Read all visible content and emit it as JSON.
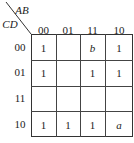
{
  "kmap": {
    "row_var": "CD",
    "col_var": "AB",
    "col_headers": [
      "00",
      "01",
      "11",
      "10"
    ],
    "row_headers": [
      "00",
      "01",
      "11",
      "10"
    ],
    "cells": [
      [
        "1",
        "",
        "b",
        "1"
      ],
      [
        "1",
        "",
        "1",
        "1"
      ],
      [
        "",
        "",
        "",
        ""
      ],
      [
        "1",
        "1",
        "1",
        "a"
      ]
    ]
  }
}
